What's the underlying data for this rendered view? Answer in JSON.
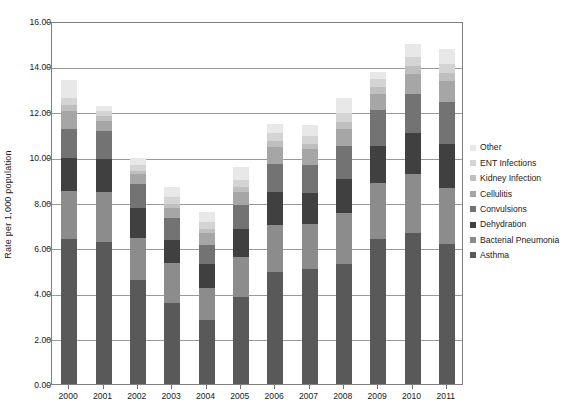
{
  "chart_data": {
    "type": "bar",
    "stacked": true,
    "title": "",
    "xlabel": "",
    "ylabel": "Rate per 1,000 population",
    "ylim": [
      0.0,
      16.0
    ],
    "ytick_labels": [
      "0.00",
      "2.00",
      "4.00",
      "6.00",
      "8.00",
      "10.00",
      "12.00",
      "14.00",
      "16.00"
    ],
    "ytick_values": [
      0,
      2,
      4,
      6,
      8,
      10,
      12,
      14,
      16
    ],
    "grid": true,
    "legend_position": "right",
    "categories": [
      "2000",
      "2001",
      "2002",
      "2003",
      "2004",
      "2005",
      "2006",
      "2007",
      "2008",
      "2009",
      "2010",
      "2011"
    ],
    "series": [
      {
        "name": "Asthma",
        "color": "#595959",
        "values": [
          6.4,
          6.25,
          4.6,
          3.55,
          2.8,
          3.85,
          4.95,
          5.05,
          5.3,
          6.4,
          6.65,
          6.15
        ]
      },
      {
        "name": "Bacterial Pneumonia",
        "color": "#8c8c8c",
        "values": [
          2.1,
          2.2,
          1.85,
          1.8,
          1.45,
          1.75,
          2.05,
          2.0,
          2.25,
          2.45,
          2.6,
          2.5
        ]
      },
      {
        "name": "Dehydration",
        "color": "#404040",
        "values": [
          1.45,
          1.45,
          1.3,
          1.0,
          1.05,
          1.25,
          1.45,
          1.35,
          1.5,
          1.65,
          1.8,
          1.95
        ]
      },
      {
        "name": "Convulsions",
        "color": "#737373",
        "values": [
          1.3,
          1.25,
          1.05,
          0.95,
          0.85,
          1.05,
          1.25,
          1.25,
          1.45,
          1.6,
          1.75,
          1.85
        ]
      },
      {
        "name": "Cellulitis",
        "color": "#a6a6a6",
        "values": [
          0.8,
          0.45,
          0.45,
          0.45,
          0.5,
          0.55,
          0.75,
          0.7,
          0.75,
          0.7,
          0.85,
          0.9
        ]
      },
      {
        "name": "Kidney Infection",
        "color": "#bfbfbf",
        "values": [
          0.25,
          0.2,
          0.15,
          0.2,
          0.2,
          0.25,
          0.25,
          0.25,
          0.3,
          0.3,
          0.35,
          0.35
        ],
        "note": "thin band"
      },
      {
        "name": "ENT Infections",
        "color": "#d4d4d4",
        "values": [
          0.3,
          0.25,
          0.25,
          0.3,
          0.3,
          0.3,
          0.35,
          0.35,
          0.4,
          0.35,
          0.4,
          0.4
        ]
      },
      {
        "name": "Other",
        "color": "#e8e8e8",
        "values": [
          0.8,
          0.2,
          0.3,
          0.45,
          0.45,
          0.55,
          0.4,
          0.45,
          0.65,
          0.3,
          0.6,
          0.65
        ]
      }
    ],
    "totals": [
      13.4,
      12.25,
      9.95,
      8.7,
      7.6,
      9.55,
      11.45,
      11.4,
      12.6,
      13.75,
      15.0,
      14.75
    ]
  },
  "legend": {
    "items": [
      {
        "label": "Other",
        "color": "#e8e8e8"
      },
      {
        "label": "ENT Infections",
        "color": "#d4d4d4"
      },
      {
        "label": "Kidney Infection",
        "color": "#bfbfbf"
      },
      {
        "label": "Cellulitis",
        "color": "#a6a6a6"
      },
      {
        "label": "Convulsions",
        "color": "#737373"
      },
      {
        "label": "Dehydration",
        "color": "#404040"
      },
      {
        "label": "Bacterial Pneumonia",
        "color": "#8c8c8c"
      },
      {
        "label": "Asthma",
        "color": "#595959"
      }
    ]
  },
  "axis": {
    "y_title": "Rate per 1,000 population"
  }
}
